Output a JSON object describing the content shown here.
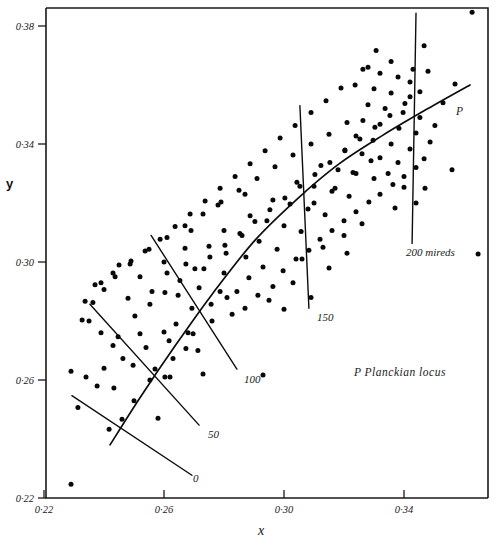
{
  "chart_data": {
    "type": "scatter",
    "title": "",
    "xlabel": "x",
    "ylabel": "y",
    "xlim": [
      0.22,
      0.3667
    ],
    "ylim": [
      0.22,
      0.3867
    ],
    "grid": false,
    "legend_position": "inside-lower-right",
    "x_ticks": [
      {
        "value": 0.22,
        "label": "0·22"
      },
      {
        "value": 0.26,
        "label": "0·26"
      },
      {
        "value": 0.3,
        "label": "0·30"
      },
      {
        "value": 0.34,
        "label": "0·34"
      }
    ],
    "y_ticks": [
      {
        "value": 0.22,
        "label": "0·22"
      },
      {
        "value": 0.26,
        "label": "0·26"
      },
      {
        "value": 0.3,
        "label": "0·30"
      },
      {
        "value": 0.34,
        "label": "0·34"
      },
      {
        "value": 0.38,
        "label": "0·38"
      }
    ],
    "annotations": [
      {
        "name": "planckian-locus-tag",
        "text": "P",
        "x": 0.3573,
        "y": 0.3497
      },
      {
        "name": "legend-planckian",
        "text": "P  Planckian locus",
        "x": 0.3233,
        "y": 0.2613
      }
    ],
    "isotemperature_lines": [
      {
        "name": "0",
        "label": "0",
        "label_x": 0.2697,
        "label_y": 0.2253,
        "points": [
          [
            0.2293,
            0.2547
          ],
          [
            0.2693,
            0.2277
          ]
        ]
      },
      {
        "name": "50",
        "label": "50",
        "label_x": 0.2747,
        "label_y": 0.2403,
        "points": [
          [
            0.2353,
            0.2857
          ],
          [
            0.2717,
            0.2447
          ]
        ]
      },
      {
        "name": "100",
        "label": "100",
        "label_x": 0.2867,
        "label_y": 0.259,
        "points": [
          [
            0.2557,
            0.309
          ],
          [
            0.2843,
            0.2637
          ]
        ]
      },
      {
        "name": "150",
        "label": "150",
        "label_x": 0.311,
        "label_y": 0.28,
        "points": [
          [
            0.3053,
            0.353
          ],
          [
            0.3083,
            0.2843
          ]
        ]
      },
      {
        "name": "200 mireds",
        "label": "200 mireds",
        "label_x": 0.3407,
        "label_y": 0.302,
        "points": [
          [
            0.344,
            0.3843
          ],
          [
            0.3427,
            0.3063
          ]
        ]
      }
    ],
    "planckian_locus": [
      [
        0.242,
        0.238
      ],
      [
        0.252,
        0.254
      ],
      [
        0.264,
        0.272
      ],
      [
        0.276,
        0.289
      ],
      [
        0.29,
        0.307
      ],
      [
        0.304,
        0.321
      ],
      [
        0.318,
        0.333
      ],
      [
        0.333,
        0.343
      ],
      [
        0.348,
        0.352
      ],
      [
        0.362,
        0.36
      ]
    ],
    "points": [
      [
        0.229,
        0.2247
      ],
      [
        0.2313,
        0.2507
      ],
      [
        0.2417,
        0.2433
      ],
      [
        0.246,
        0.2467
      ],
      [
        0.2377,
        0.258
      ],
      [
        0.2433,
        0.2573
      ],
      [
        0.25,
        0.253
      ],
      [
        0.2553,
        0.26
      ],
      [
        0.2497,
        0.265
      ],
      [
        0.257,
        0.2637
      ],
      [
        0.2603,
        0.261
      ],
      [
        0.263,
        0.2673
      ],
      [
        0.2617,
        0.2733
      ],
      [
        0.254,
        0.271
      ],
      [
        0.2673,
        0.2707
      ],
      [
        0.2697,
        0.2757
      ],
      [
        0.2713,
        0.27
      ],
      [
        0.264,
        0.279
      ],
      [
        0.276,
        0.28
      ],
      [
        0.2693,
        0.2843
      ],
      [
        0.2757,
        0.2857
      ],
      [
        0.2827,
        0.2823
      ],
      [
        0.2647,
        0.2887
      ],
      [
        0.2717,
        0.2913
      ],
      [
        0.2787,
        0.29
      ],
      [
        0.2843,
        0.29
      ],
      [
        0.2883,
        0.2947
      ],
      [
        0.28,
        0.2963
      ],
      [
        0.2733,
        0.2977
      ],
      [
        0.2673,
        0.2993
      ],
      [
        0.2913,
        0.2887
      ],
      [
        0.2963,
        0.2917
      ],
      [
        0.293,
        0.2983
      ],
      [
        0.2873,
        0.3017
      ],
      [
        0.2807,
        0.303
      ],
      [
        0.275,
        0.3053
      ],
      [
        0.2997,
        0.297
      ],
      [
        0.304,
        0.301
      ],
      [
        0.2977,
        0.3043
      ],
      [
        0.2917,
        0.307
      ],
      [
        0.286,
        0.309
      ],
      [
        0.28,
        0.3107
      ],
      [
        0.3083,
        0.304
      ],
      [
        0.312,
        0.3077
      ],
      [
        0.3057,
        0.3103
      ],
      [
        0.3,
        0.3123
      ],
      [
        0.2943,
        0.314
      ],
      [
        0.2887,
        0.3157
      ],
      [
        0.316,
        0.3107
      ],
      [
        0.32,
        0.314
      ],
      [
        0.3137,
        0.316
      ],
      [
        0.308,
        0.318
      ],
      [
        0.302,
        0.3197
      ],
      [
        0.2963,
        0.321
      ],
      [
        0.324,
        0.317
      ],
      [
        0.3283,
        0.3203
      ],
      [
        0.3217,
        0.3223
      ],
      [
        0.316,
        0.324
      ],
      [
        0.31,
        0.3257
      ],
      [
        0.3043,
        0.327
      ],
      [
        0.332,
        0.323
      ],
      [
        0.3363,
        0.3263
      ],
      [
        0.33,
        0.3283
      ],
      [
        0.324,
        0.33
      ],
      [
        0.318,
        0.3313
      ],
      [
        0.3123,
        0.3327
      ],
      [
        0.34,
        0.329
      ],
      [
        0.344,
        0.332
      ],
      [
        0.338,
        0.3337
      ],
      [
        0.332,
        0.3353
      ],
      [
        0.326,
        0.3367
      ],
      [
        0.3203,
        0.338
      ],
      [
        0.3467,
        0.335
      ],
      [
        0.342,
        0.3383
      ],
      [
        0.3357,
        0.34
      ],
      [
        0.3297,
        0.3413
      ],
      [
        0.324,
        0.3427
      ],
      [
        0.3487,
        0.3407
      ],
      [
        0.344,
        0.3437
      ],
      [
        0.3383,
        0.3453
      ],
      [
        0.332,
        0.3467
      ],
      [
        0.3263,
        0.348
      ],
      [
        0.3503,
        0.3463
      ],
      [
        0.3453,
        0.349
      ],
      [
        0.3397,
        0.3507
      ],
      [
        0.3337,
        0.352
      ],
      [
        0.328,
        0.3533
      ],
      [
        0.342,
        0.356
      ],
      [
        0.3357,
        0.3573
      ],
      [
        0.33,
        0.3587
      ],
      [
        0.3237,
        0.36
      ],
      [
        0.338,
        0.3627
      ],
      [
        0.332,
        0.364
      ],
      [
        0.3263,
        0.3653
      ],
      [
        0.319,
        0.359
      ],
      [
        0.314,
        0.3547
      ],
      [
        0.309,
        0.3507
      ],
      [
        0.3037,
        0.3463
      ],
      [
        0.2987,
        0.342
      ],
      [
        0.2937,
        0.3377
      ],
      [
        0.2887,
        0.3333
      ],
      [
        0.2837,
        0.329
      ],
      [
        0.2787,
        0.325
      ],
      [
        0.2737,
        0.3207
      ],
      [
        0.2687,
        0.3163
      ],
      [
        0.2637,
        0.312
      ],
      [
        0.2587,
        0.3077
      ],
      [
        0.2537,
        0.3037
      ],
      [
        0.2487,
        0.2993
      ],
      [
        0.2437,
        0.295
      ],
      [
        0.24,
        0.2907
      ],
      [
        0.2363,
        0.2863
      ],
      [
        0.235,
        0.28
      ],
      [
        0.239,
        0.276
      ],
      [
        0.243,
        0.2717
      ],
      [
        0.2463,
        0.2673
      ],
      [
        0.2503,
        0.2817
      ],
      [
        0.2553,
        0.2857
      ],
      [
        0.2603,
        0.2897
      ],
      [
        0.2653,
        0.2937
      ],
      [
        0.2703,
        0.2977
      ],
      [
        0.2753,
        0.3017
      ],
      [
        0.2803,
        0.3057
      ],
      [
        0.2853,
        0.3097
      ],
      [
        0.2903,
        0.3137
      ],
      [
        0.2953,
        0.3177
      ],
      [
        0.3003,
        0.3217
      ],
      [
        0.3053,
        0.3257
      ],
      [
        0.3103,
        0.3297
      ],
      [
        0.3153,
        0.3337
      ],
      [
        0.3203,
        0.3377
      ],
      [
        0.3253,
        0.3417
      ],
      [
        0.3303,
        0.3457
      ],
      [
        0.3353,
        0.3497
      ],
      [
        0.3403,
        0.3537
      ],
      [
        0.3453,
        0.3577
      ],
      [
        0.3467,
        0.3733
      ],
      [
        0.3627,
        0.3847
      ],
      [
        0.3307,
        0.3717
      ],
      [
        0.343,
        0.3653
      ],
      [
        0.3647,
        0.3027
      ],
      [
        0.262,
        0.261
      ],
      [
        0.258,
        0.247
      ],
      [
        0.293,
        0.2617
      ],
      [
        0.256,
        0.29
      ],
      [
        0.248,
        0.2877
      ],
      [
        0.261,
        0.2963
      ],
      [
        0.273,
        0.262
      ],
      [
        0.303,
        0.293
      ],
      [
        0.309,
        0.288
      ],
      [
        0.287,
        0.323
      ],
      [
        0.278,
        0.3193
      ],
      [
        0.269,
        0.3107
      ],
      [
        0.321,
        0.303
      ],
      [
        0.315,
        0.298
      ],
      [
        0.337,
        0.3183
      ],
      [
        0.347,
        0.325
      ],
      [
        0.356,
        0.3313
      ],
      [
        0.353,
        0.354
      ],
      [
        0.357,
        0.3603
      ],
      [
        0.2447,
        0.2747
      ],
      [
        0.252,
        0.2757
      ],
      [
        0.26,
        0.2763
      ],
      [
        0.268,
        0.276
      ],
      [
        0.24,
        0.264
      ],
      [
        0.234,
        0.261
      ],
      [
        0.229,
        0.263
      ],
      [
        0.252,
        0.295
      ],
      [
        0.245,
        0.299
      ],
      [
        0.239,
        0.293
      ],
      [
        0.26,
        0.3
      ],
      [
        0.267,
        0.3047
      ],
      [
        0.281,
        0.288
      ],
      [
        0.287,
        0.2843
      ],
      [
        0.295,
        0.287
      ],
      [
        0.3,
        0.284
      ],
      [
        0.31,
        0.32
      ],
      [
        0.317,
        0.325
      ],
      [
        0.323,
        0.3303
      ],
      [
        0.329,
        0.3343
      ],
      [
        0.3347,
        0.33
      ],
      [
        0.34,
        0.3253
      ],
      [
        0.344,
        0.32
      ],
      [
        0.326,
        0.313
      ],
      [
        0.32,
        0.309
      ],
      [
        0.313,
        0.305
      ],
      [
        0.306,
        0.301
      ],
      [
        0.342,
        0.361
      ],
      [
        0.348,
        0.3647
      ],
      [
        0.3357,
        0.368
      ],
      [
        0.328,
        0.366
      ],
      [
        0.321,
        0.3473
      ],
      [
        0.315,
        0.3433
      ],
      [
        0.309,
        0.34
      ],
      [
        0.303,
        0.3363
      ],
      [
        0.297,
        0.3323
      ],
      [
        0.291,
        0.3283
      ],
      [
        0.285,
        0.3243
      ],
      [
        0.279,
        0.3203
      ],
      [
        0.273,
        0.3163
      ],
      [
        0.267,
        0.3123
      ],
      [
        0.261,
        0.3083
      ],
      [
        0.255,
        0.3043
      ],
      [
        0.249,
        0.3003
      ],
      [
        0.243,
        0.2963
      ],
      [
        0.237,
        0.2923
      ],
      [
        0.2337,
        0.2867
      ],
      [
        0.2327,
        0.2803
      ]
    ]
  },
  "annotations_meta": {
    "locus_tag_name": "planckian-locus-marker",
    "legend_name": "planckian-locus-legend"
  }
}
